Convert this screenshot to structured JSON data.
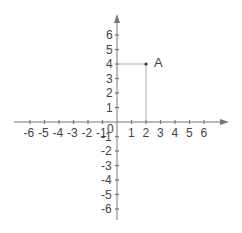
{
  "chart_data": {
    "type": "scatter",
    "title": "",
    "xlabel": "",
    "ylabel": "",
    "xlim": [
      -6,
      6
    ],
    "ylim": [
      -6,
      6
    ],
    "grid": false,
    "x_ticks": [
      "-6",
      "-5",
      "-4",
      "-3",
      "-2",
      "-1",
      "0",
      "1",
      "2",
      "3",
      "4",
      "5",
      "6"
    ],
    "y_ticks": [
      "6",
      "5",
      "4",
      "3",
      "2",
      "1",
      "-1",
      "-2",
      "-3",
      "-4",
      "-5",
      "-6"
    ],
    "origin_label": "0",
    "points": [
      {
        "label": "A",
        "x": 2,
        "y": 4,
        "projection_lines": true
      }
    ]
  },
  "colors": {
    "axis": "#777777",
    "projection": "#9a9a9a",
    "text": "#444444"
  }
}
